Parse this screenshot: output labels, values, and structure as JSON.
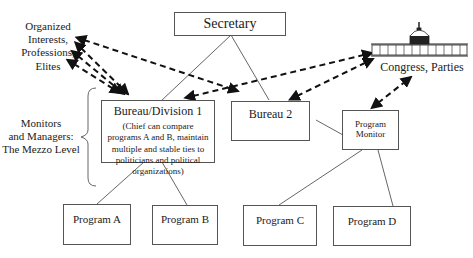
{
  "diagram": {
    "nodes": {
      "secretary": "Secretary",
      "bureau1": "Bureau/Division 1",
      "bureau1_note": "(Chief  can compare programs A and B, maintain multiple and stable ties to politicians and political organizations)",
      "bureau2": "Bureau 2",
      "program_monitor_line1": "Program",
      "program_monitor_line2": "Monitor",
      "program_a": "Program A",
      "program_b": "Program B",
      "program_c": "Program C",
      "program_d": "Program D"
    },
    "external": {
      "interests_line1": "Organized",
      "interests_line2": "Interests,",
      "interests_line3": "Professions,",
      "interests_line4": "Elites",
      "congress": "Congress, Parties",
      "congress_icon": "capitol-building-icon"
    },
    "annotation": {
      "line1": "Monitors",
      "line2": "and Managers:",
      "line3": "The Mezzo Level"
    },
    "edges": [
      {
        "from": "secretary",
        "to": "bureau1",
        "style": "solid"
      },
      {
        "from": "secretary",
        "to": "bureau2",
        "style": "solid"
      },
      {
        "from": "bureau1",
        "to": "program_a",
        "style": "solid"
      },
      {
        "from": "bureau1",
        "to": "program_b",
        "style": "solid"
      },
      {
        "from": "bureau2",
        "to": "program_monitor",
        "style": "solid"
      },
      {
        "from": "program_monitor",
        "to": "program_c",
        "style": "solid"
      },
      {
        "from": "program_monitor",
        "to": "program_d",
        "style": "solid"
      },
      {
        "from": "bureau1",
        "to": "interests",
        "style": "dashed-bidirectional",
        "count": 3
      },
      {
        "from": "bureau2",
        "to": "interests",
        "style": "dashed-bidirectional"
      },
      {
        "from": "bureau1",
        "to": "congress",
        "style": "dashed-bidirectional"
      },
      {
        "from": "bureau2",
        "to": "congress",
        "style": "dashed-bidirectional"
      },
      {
        "from": "program_monitor",
        "to": "congress",
        "style": "dashed-bidirectional"
      }
    ]
  }
}
